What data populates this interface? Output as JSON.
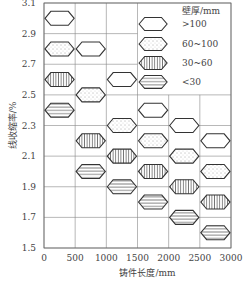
{
  "chart_data": {
    "type": "scatter",
    "title": "",
    "xlabel": "铸件长度/mm",
    "ylabel": "线收缩率/%",
    "xlim": [
      0,
      3000
    ],
    "ylim": [
      1.5,
      3.1
    ],
    "xticks": [
      0,
      500,
      1000,
      1500,
      2000,
      2500,
      3000
    ],
    "yticks": [
      1.5,
      1.7,
      1.9,
      2.1,
      2.3,
      2.5,
      2.7,
      2.9,
      3.1
    ],
    "grid": true,
    "legend": {
      "title": "壁厚/mm",
      "position": "upper right",
      "entries": [
        ">100",
        "60~100",
        "30~60",
        "<30"
      ]
    },
    "categories": [
      "0-500",
      "500-1000",
      "1000-1500",
      "1500-2000",
      "2000-2500",
      "2500-3000"
    ],
    "series": [
      {
        "name": ">100",
        "pattern": "empty",
        "values": [
          3.0,
          2.8,
          2.6,
          2.4,
          2.3,
          2.2
        ]
      },
      {
        "name": "60~100",
        "pattern": "dotted",
        "values": [
          2.8,
          2.5,
          2.3,
          2.2,
          2.1,
          2.0
        ]
      },
      {
        "name": "30~60",
        "pattern": "vertical-lines",
        "values": [
          2.6,
          2.2,
          2.1,
          2.0,
          1.9,
          1.8
        ]
      },
      {
        "name": "<30",
        "pattern": "horizontal-lines",
        "values": [
          2.4,
          2.0,
          1.9,
          1.8,
          1.7,
          1.6
        ]
      }
    ]
  }
}
